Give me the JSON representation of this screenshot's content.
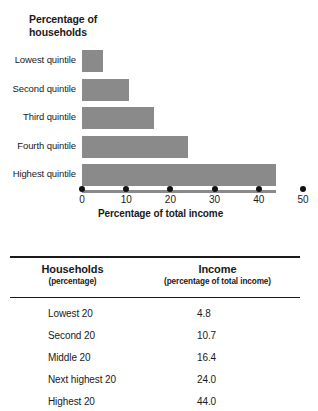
{
  "chart_data": {
    "type": "bar",
    "orientation": "horizontal",
    "title": "Percentage of\nhouseholds",
    "xlabel": "Percentage of total income",
    "ylabel": "",
    "categories": [
      "Lowest quintile",
      "Second quintile",
      "Third quintile",
      "Fourth quintile",
      "Highest quintile"
    ],
    "values": [
      4.8,
      10.7,
      16.4,
      24.0,
      44.0
    ],
    "xlim": [
      0,
      50
    ],
    "xticks": [
      0,
      10,
      20,
      30,
      40,
      50
    ],
    "xtick_labels": [
      "0",
      "10",
      "20",
      "30",
      "40",
      "50"
    ],
    "grid": false,
    "legend": null,
    "bar_color": "#8a8a8a",
    "axis_marker": "dot",
    "axis_marker_color": "#111111"
  },
  "chart": {
    "title": "Percentage of\nhouseholds",
    "axis_title": "Percentage of total income",
    "bars": [
      {
        "label": "Lowest quintile",
        "value": 4.8
      },
      {
        "label": "Second quintile",
        "value": 10.7
      },
      {
        "label": "Third quintile",
        "value": 16.4
      },
      {
        "label": "Fourth quintile",
        "value": 24.0
      },
      {
        "label": "Highest quintile",
        "value": 44.0
      }
    ],
    "ticks": [
      "0",
      "10",
      "20",
      "30",
      "40",
      "50"
    ]
  },
  "table": {
    "columns": [
      {
        "title": "Households",
        "subtitle": "(percentage)"
      },
      {
        "title": "Income",
        "subtitle": "(percentage of total income)"
      }
    ],
    "rows": [
      {
        "households": "Lowest 20",
        "income": "4.8"
      },
      {
        "households": "Second 20",
        "income": "10.7"
      },
      {
        "households": "Middle 20",
        "income": "16.4"
      },
      {
        "households": "Next highest 20",
        "income": "24.0"
      },
      {
        "households": "Highest 20",
        "income": "44.0"
      }
    ]
  }
}
